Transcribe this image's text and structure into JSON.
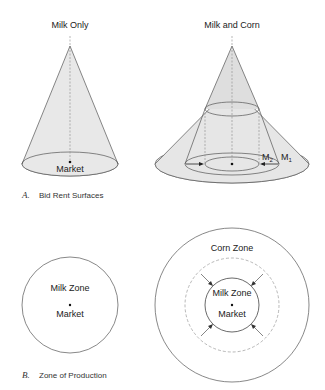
{
  "panel_a": {
    "caption_letter": "A.",
    "caption_text": "Bid Rent Surfaces",
    "left": {
      "title": "Milk Only",
      "center_label": "Market"
    },
    "right": {
      "title": "Milk and Corn",
      "label_m1": "M",
      "label_m1_sub": "1",
      "label_m2": "M",
      "label_m2_sub": "2"
    }
  },
  "panel_b": {
    "caption_letter": "B.",
    "caption_text": "Zone of Production",
    "left": {
      "zone_label": "Milk Zone",
      "center_label": "Market"
    },
    "right": {
      "outer_zone_label": "Corn Zone",
      "inner_zone_label": "Milk Zone",
      "center_label": "Market"
    }
  },
  "colors": {
    "fill": "#e6e6e6",
    "stroke": "#555555",
    "dashed": "#888888"
  }
}
